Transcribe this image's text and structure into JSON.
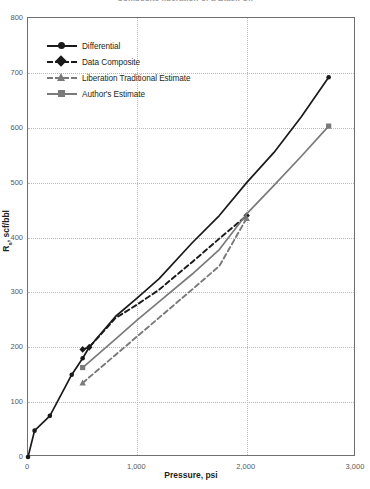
{
  "chart_data": {
    "type": "line",
    "title": "Composite liberation of a Black Oil",
    "xlabel": "Pressure, psi",
    "ylabel": "Rs, scf/bbl",
    "xlim": [
      0,
      3000
    ],
    "ylim": [
      0,
      800
    ],
    "xticks": [
      0,
      1000,
      2000,
      3000
    ],
    "xticklabels": [
      "0",
      "1,000",
      "2,000",
      "3,000"
    ],
    "yticks": [
      0,
      100,
      200,
      300,
      400,
      500,
      600,
      700,
      800
    ],
    "yticklabels": [
      "0",
      "100",
      "200",
      "300",
      "400",
      "500",
      "600",
      "700",
      "800"
    ],
    "grid": "dotted",
    "legend_position": "upper-left-inside",
    "series": [
      {
        "name": "Differential",
        "color": "#1a1a1a",
        "linestyle": "solid",
        "marker": "circle",
        "x": [
          0,
          60,
          200,
          400,
          500,
          560,
          800,
          1000,
          1200,
          1500,
          1750,
          2000,
          2250,
          2500,
          2750
        ],
        "y": [
          0,
          48,
          75,
          150,
          180,
          200,
          256,
          290,
          325,
          390,
          440,
          500,
          555,
          620,
          692
        ]
      },
      {
        "name": "Data Composite",
        "color": "#1a1a1a",
        "linestyle": "dashed",
        "marker": "diamond",
        "x": [
          500,
          560,
          800,
          1000,
          1200,
          1500,
          1750,
          2000
        ],
        "y": [
          196,
          200,
          253,
          278,
          305,
          355,
          398,
          440
        ]
      },
      {
        "name": "Liberation Traditional Estimate",
        "color": "#7a7a7a",
        "linestyle": "dashed",
        "marker": "triangle",
        "x": [
          500,
          800,
          1000,
          1200,
          1500,
          1750,
          2000
        ],
        "y": [
          135,
          186,
          220,
          254,
          305,
          348,
          435
        ]
      },
      {
        "name": "Author's Estimate",
        "color": "#7a7a7a",
        "linestyle": "solid",
        "marker": "square",
        "x": [
          500,
          800,
          1000,
          1200,
          1500,
          1750,
          2000,
          2250,
          2500,
          2750
        ],
        "y": [
          163,
          215,
          250,
          283,
          333,
          378,
          443,
          495,
          548,
          603
        ]
      }
    ]
  },
  "axes": {
    "x_title": "Pressure, psi",
    "y_title_main": "R",
    "y_title_sub": "s",
    "y_title_rest": ", scf/bbl"
  },
  "legend": {
    "items": [
      {
        "label": "Differential",
        "marker": "circle-marker",
        "style": "solid-black"
      },
      {
        "label": "Data Composite",
        "marker": "diamond-marker",
        "style": "dashed-black"
      },
      {
        "label": "Liberation Traditional Estimate",
        "marker": "triangle-marker",
        "style": "dashed-gray"
      },
      {
        "label": "Author's Estimate",
        "marker": "square-marker",
        "style": "solid-gray"
      }
    ]
  },
  "colors": {
    "black": "#1a1a1a",
    "gray": "#7a7a7a",
    "grid": "#b9b9b9",
    "frame": "#6f6f6f"
  }
}
